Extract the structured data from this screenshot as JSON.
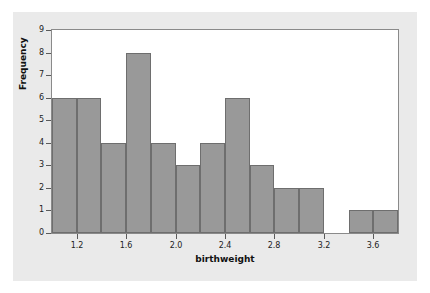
{
  "figure": {
    "panel_bg": "#eaeaea",
    "page_bg": "#ffffff",
    "plot_bg": "#ffffff",
    "bar_fill": "#999999",
    "bar_edge": "#6e6e6e",
    "axis_color": "#8a8a8a"
  },
  "chart_data": {
    "type": "bar",
    "title": "",
    "subtitle": "",
    "xlabel": "birthweight",
    "ylabel": "Frequency",
    "grid": false,
    "legend": "none",
    "xlim": [
      1.0,
      3.8
    ],
    "ylim": [
      0,
      9
    ],
    "bin_width": 0.2,
    "bin_edges": [
      1.0,
      1.2,
      1.4,
      1.6,
      1.8,
      2.0,
      2.2,
      2.4,
      2.6,
      2.8,
      3.0,
      3.2,
      3.4,
      3.6,
      3.8
    ],
    "bin_centers": [
      1.1,
      1.3,
      1.5,
      1.7,
      1.9,
      2.1,
      2.3,
      2.5,
      2.7,
      2.9,
      3.1,
      3.3,
      3.5,
      3.7
    ],
    "categories": [
      "1.0-1.2",
      "1.2-1.4",
      "1.4-1.6",
      "1.6-1.8",
      "1.8-2.0",
      "2.0-2.2",
      "2.2-2.4",
      "2.4-2.6",
      "2.6-2.8",
      "2.8-3.0",
      "3.0-3.2",
      "3.2-3.4",
      "3.4-3.6",
      "3.6-3.8"
    ],
    "values": [
      6,
      6,
      4,
      8,
      4,
      3,
      4,
      6,
      3,
      2,
      2,
      0,
      1,
      1
    ],
    "x_ticks": [
      1.2,
      1.6,
      2.0,
      2.4,
      2.8,
      3.2,
      3.6
    ],
    "x_tick_labels": [
      "1.2",
      "1.6",
      "2.0",
      "2.4",
      "2.8",
      "3.2",
      "3.6"
    ],
    "y_ticks": [
      0,
      1,
      2,
      3,
      4,
      5,
      6,
      7,
      8,
      9
    ],
    "y_tick_labels": [
      "0",
      "1",
      "2",
      "3",
      "4",
      "5",
      "6",
      "7",
      "8",
      "9"
    ],
    "total_count": 50
  }
}
